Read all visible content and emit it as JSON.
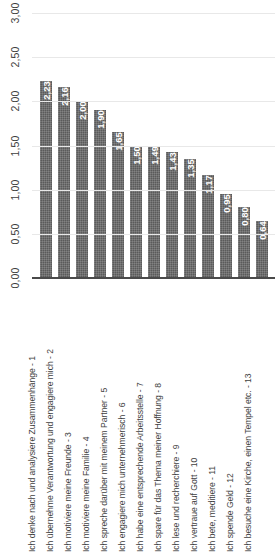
{
  "chart_data": {
    "type": "bar",
    "title": "",
    "subtitle": "",
    "xlabel": "",
    "ylabel": "",
    "ylim": [
      0,
      3
    ],
    "grid": true,
    "legend": null,
    "orientation": "vertical",
    "bar_color": "#5a5a5a",
    "gridline_color": "#e8e8e8",
    "axis_color": "#4a4a4a",
    "label_color": "#ffffff",
    "decimal_separator": ",",
    "y_ticks": [
      "0,00",
      "0,50",
      "1,00",
      "1,50",
      "2,00",
      "2,50",
      "3,00"
    ],
    "y_tick_values": [
      0,
      0.5,
      1.0,
      1.5,
      2.0,
      2.5,
      3.0
    ],
    "categories": [
      "Ich denke nach und analysiere Zusammenhänge - 1",
      "Ich übernehme Verantwortung und engagiere mich - 2",
      "Ich motiviere meine Freunde - 3",
      "Ich motiviere meine Familie - 4",
      "Ich spreche darüber mit meinem Partner - 5",
      "Ich engagiere mich unternehmerisch - 6",
      "Ich habe eine entsprechende Arbeitsstelle - 7",
      "Ich spare für das Thema meiner Hoffnung - 8",
      "Ich lese und recherchiere - 9",
      "Ich vertraue auf Gott - 10",
      "Ich bete, meditiere - 11",
      "Ich spende Geld - 12",
      "Ich besuche eine Kirche, einen Tempel etc. - 13"
    ],
    "values": [
      2.23,
      2.16,
      2.0,
      1.9,
      1.65,
      1.5,
      1.49,
      1.43,
      1.35,
      1.17,
      0.95,
      0.8,
      0.64
    ],
    "value_labels": [
      "2,23",
      "2,16",
      "2,00",
      "1,90",
      "1,65",
      "1,50",
      "1,49",
      "1,43",
      "1,35",
      "1,17",
      "0,95",
      "0,80",
      "0,64"
    ]
  }
}
